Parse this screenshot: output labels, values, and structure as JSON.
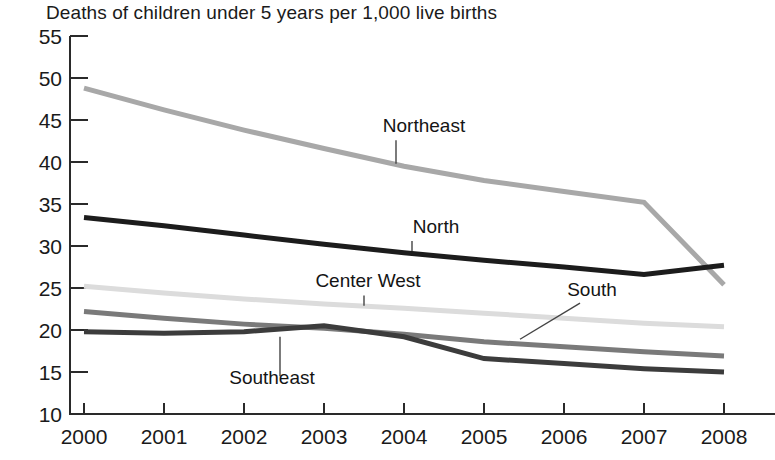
{
  "chart_data": {
    "type": "line",
    "title": "Deaths of children under 5 years per 1,000 live births",
    "subtitle": "",
    "xlabel": "",
    "ylabel": "",
    "xlim": [
      2000,
      2008
    ],
    "ylim": [
      10,
      55
    ],
    "grid": false,
    "legend_position": "inline-annotations",
    "x": [
      2000,
      2001,
      2002,
      2003,
      2004,
      2005,
      2006,
      2007,
      2008
    ],
    "xticks": [
      "2000",
      "2001",
      "2002",
      "2003",
      "2004",
      "2005",
      "2006",
      "2007",
      "2008"
    ],
    "yticks": [
      "10",
      "15",
      "20",
      "25",
      "30",
      "35",
      "40",
      "45",
      "50",
      "55"
    ],
    "ytick_values": [
      10,
      15,
      20,
      25,
      30,
      35,
      40,
      45,
      50,
      55
    ],
    "series": [
      {
        "name": "Northeast",
        "color": "#a8a8a8",
        "width": 5,
        "values": [
          48.8,
          46.2,
          43.8,
          41.6,
          39.5,
          37.8,
          36.5,
          35.2,
          25.4
        ],
        "label_x": 2004.25,
        "label_y": 43.6,
        "leader_from": [
          2003.9,
          42.6
        ],
        "leader_to": [
          2003.9,
          39.8
        ]
      },
      {
        "name": "North",
        "color": "#1c1c1c",
        "width": 5,
        "values": [
          33.4,
          32.4,
          31.3,
          30.2,
          29.2,
          28.3,
          27.5,
          26.6,
          27.7
        ],
        "label_x": 2004.4,
        "label_y": 31.6,
        "leader_from": [
          2004.1,
          30.6
        ],
        "leader_to": [
          2004.1,
          29.4
        ]
      },
      {
        "name": "Center West",
        "color": "#dcdcdc",
        "width": 5,
        "values": [
          25.2,
          24.4,
          23.7,
          23.1,
          22.6,
          22.0,
          21.4,
          20.8,
          20.4
        ],
        "label_x": 2003.55,
        "label_y": 25.1,
        "leader_from": [
          2003.5,
          24.1
        ],
        "leader_to": [
          2003.5,
          22.9
        ]
      },
      {
        "name": "South",
        "color": "#7a7a7a",
        "width": 5,
        "values": [
          22.2,
          21.4,
          20.7,
          20.2,
          19.5,
          18.6,
          18.0,
          17.4,
          16.9
        ],
        "label_x": 2006.35,
        "label_y": 24.0,
        "leader_from": [
          2006.2,
          23.2
        ],
        "leader_to": [
          2005.45,
          18.9
        ]
      },
      {
        "name": "Southeast",
        "color": "#3c3c3c",
        "width": 5,
        "values": [
          19.8,
          19.6,
          19.8,
          20.5,
          19.2,
          16.6,
          16.0,
          15.4,
          15.0
        ],
        "label_x": 2002.35,
        "label_y": 13.6,
        "leader_from": [
          2002.45,
          14.5
        ],
        "leader_to": [
          2002.45,
          19.2
        ]
      }
    ]
  }
}
